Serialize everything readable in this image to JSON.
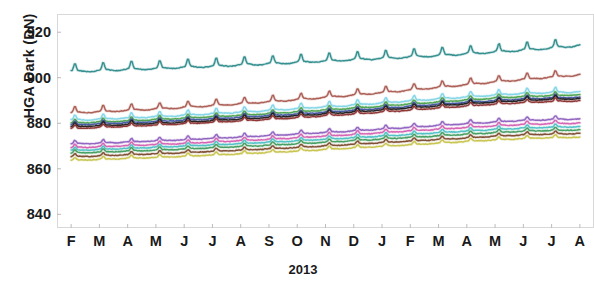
{
  "chart_data": {
    "type": "line",
    "title": "",
    "subtitle": "",
    "xlabel": "2013",
    "ylabel": "HGA Dark (DN)",
    "ylim": [
      834,
      928
    ],
    "yticks": [
      840,
      860,
      880,
      900,
      920
    ],
    "xlim": [
      0,
      19
    ],
    "xticks": [
      0.5,
      1.5,
      2.5,
      3.5,
      4.5,
      5.5,
      6.5,
      7.5,
      8.5,
      9.5,
      10.5,
      11.5,
      12.5,
      13.5,
      14.5,
      15.5,
      16.5,
      17.5,
      18.5
    ],
    "categories": [
      "F",
      "M",
      "A",
      "M",
      "J",
      "J",
      "A",
      "S",
      "O",
      "N",
      "D",
      "J",
      "F",
      "M",
      "A",
      "M",
      "J",
      "J",
      "A"
    ],
    "grid": false,
    "legend": false,
    "legend_position": "none",
    "annotations": [],
    "series": [
      {
        "name": "detector-01",
        "color": "#2e8b8b",
        "baseline_start": 903.0,
        "baseline_end": 914.5,
        "spike": 3.4,
        "values": [
          903.0,
          903.4,
          904.0,
          904.3,
          904.9,
          905.3,
          905.9,
          906.4,
          907.0,
          907.6,
          908.2,
          908.8,
          909.4,
          910.1,
          910.8,
          911.6,
          912.4,
          913.3,
          914.5
        ]
      },
      {
        "name": "detector-02",
        "color": "#a9584f",
        "baseline_start": 884.8,
        "baseline_end": 901.5,
        "spike": 2.6,
        "values": [
          884.8,
          885.3,
          885.9,
          886.5,
          887.2,
          888.0,
          888.8,
          889.7,
          890.6,
          891.6,
          892.6,
          893.7,
          894.8,
          896.0,
          897.2,
          898.4,
          899.5,
          900.5,
          901.5
        ]
      },
      {
        "name": "detector-03",
        "color": "#7fd4e8",
        "baseline_start": 881.5,
        "baseline_end": 894.0,
        "spike": 2.2,
        "values": [
          881.5,
          882.0,
          882.5,
          883.1,
          883.7,
          884.4,
          885.1,
          885.8,
          886.6,
          887.4,
          888.2,
          889.1,
          890.0,
          890.9,
          891.8,
          892.6,
          893.3,
          893.7,
          894.0
        ]
      },
      {
        "name": "detector-04",
        "color": "#4aa24a",
        "baseline_start": 880.2,
        "baseline_end": 892.6,
        "spike": 1.6,
        "values": [
          880.2,
          880.7,
          881.2,
          881.8,
          882.4,
          883.0,
          883.7,
          884.4,
          885.2,
          886.0,
          886.8,
          887.7,
          888.6,
          889.5,
          890.4,
          891.2,
          891.9,
          892.3,
          892.6
        ]
      },
      {
        "name": "detector-05",
        "color": "#4558a8",
        "baseline_start": 879.4,
        "baseline_end": 891.6,
        "spike": 1.5,
        "values": [
          879.4,
          879.9,
          880.4,
          880.9,
          881.5,
          882.1,
          882.8,
          883.5,
          884.2,
          885.0,
          885.8,
          886.7,
          887.6,
          888.5,
          889.3,
          890.1,
          890.8,
          891.3,
          891.6
        ]
      },
      {
        "name": "detector-06",
        "color": "#1c1c1c",
        "baseline_start": 878.6,
        "baseline_end": 891.0,
        "spike": 1.6,
        "values": [
          878.6,
          879.1,
          879.6,
          880.1,
          880.7,
          881.3,
          882.0,
          882.7,
          883.5,
          884.3,
          885.1,
          886.0,
          886.9,
          887.8,
          888.7,
          889.5,
          890.2,
          890.7,
          891.0
        ]
      },
      {
        "name": "detector-07",
        "color": "#8b2f2f",
        "baseline_start": 877.8,
        "baseline_end": 890.0,
        "spike": 1.4,
        "values": [
          877.8,
          878.3,
          878.8,
          879.3,
          879.9,
          880.5,
          881.2,
          881.9,
          882.6,
          883.4,
          884.2,
          885.0,
          885.9,
          886.8,
          887.7,
          888.5,
          889.2,
          889.7,
          890.0
        ]
      },
      {
        "name": "detector-08",
        "color": "#8e5fbf",
        "baseline_start": 871.0,
        "baseline_end": 882.0,
        "spike": 1.5,
        "values": [
          871.0,
          871.4,
          871.9,
          872.4,
          872.9,
          873.5,
          874.1,
          874.7,
          875.4,
          876.1,
          876.8,
          877.6,
          878.4,
          879.2,
          880.0,
          880.7,
          881.4,
          881.8,
          882.0
        ]
      },
      {
        "name": "detector-09",
        "color": "#d45fb0",
        "baseline_start": 869.4,
        "baseline_end": 880.2,
        "spike": 1.4,
        "values": [
          869.4,
          869.8,
          870.3,
          870.8,
          871.3,
          871.9,
          872.5,
          873.1,
          873.8,
          874.5,
          875.2,
          876.0,
          876.8,
          877.5,
          878.3,
          879.0,
          879.6,
          880.0,
          880.2
        ]
      },
      {
        "name": "detector-10",
        "color": "#4bbfc4",
        "baseline_start": 868.2,
        "baseline_end": 878.6,
        "spike": 1.3,
        "values": [
          868.2,
          868.6,
          869.1,
          869.6,
          870.1,
          870.6,
          871.2,
          871.8,
          872.4,
          873.1,
          873.8,
          874.5,
          875.2,
          876.0,
          876.7,
          877.4,
          878.0,
          878.4,
          878.6
        ]
      },
      {
        "name": "detector-11",
        "color": "#3f9b5c",
        "baseline_start": 867.0,
        "baseline_end": 877.2,
        "spike": 1.3,
        "values": [
          867.0,
          867.4,
          867.9,
          868.3,
          868.8,
          869.4,
          869.9,
          870.5,
          871.1,
          871.8,
          872.5,
          873.2,
          873.9,
          874.6,
          875.3,
          876.0,
          876.6,
          877.0,
          877.2
        ]
      },
      {
        "name": "detector-12",
        "color": "#7a4a2c",
        "baseline_start": 865.4,
        "baseline_end": 875.6,
        "spike": 1.2,
        "values": [
          865.4,
          865.8,
          866.3,
          866.7,
          867.2,
          867.8,
          868.3,
          868.9,
          869.5,
          870.2,
          870.9,
          871.6,
          872.3,
          873.0,
          873.7,
          874.4,
          875.0,
          875.4,
          875.6
        ]
      },
      {
        "name": "detector-13",
        "color": "#c6c24a",
        "baseline_start": 863.8,
        "baseline_end": 874.0,
        "spike": 1.2,
        "values": [
          863.8,
          864.2,
          864.7,
          865.1,
          865.6,
          866.2,
          866.7,
          867.3,
          867.9,
          868.6,
          869.3,
          870.0,
          870.7,
          871.4,
          872.1,
          872.8,
          873.4,
          873.8,
          874.0
        ]
      }
    ]
  },
  "axis": {
    "y_title": "HGA Dark (DN)",
    "x_title": "2013"
  }
}
